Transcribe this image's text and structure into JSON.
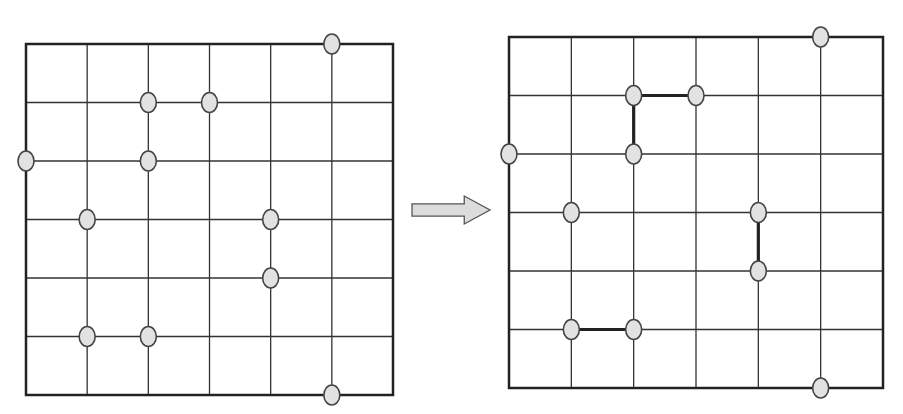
{
  "diagram": {
    "grid_size": 6,
    "node_color": "#e2e2e2",
    "line_color": "#333333",
    "arrow_fill": "#dcdcdc",
    "left_grid": {
      "x0": 26,
      "y0": 44,
      "x1": 393,
      "y1": 395,
      "nodes": [
        [
          5,
          0
        ],
        [
          2,
          1
        ],
        [
          3,
          1
        ],
        [
          0,
          2
        ],
        [
          2,
          2
        ],
        [
          1,
          3
        ],
        [
          4,
          3
        ],
        [
          4,
          4
        ],
        [
          1,
          5
        ],
        [
          2,
          5
        ],
        [
          5,
          6
        ]
      ],
      "links": []
    },
    "right_grid": {
      "x0": 509,
      "y0": 37,
      "x1": 883,
      "y1": 388,
      "nodes": [
        [
          5,
          0
        ],
        [
          2,
          1
        ],
        [
          3,
          1
        ],
        [
          0,
          2
        ],
        [
          2,
          2
        ],
        [
          1,
          3
        ],
        [
          4,
          3
        ],
        [
          4,
          4
        ],
        [
          1,
          5
        ],
        [
          2,
          5
        ],
        [
          5,
          6
        ]
      ],
      "links": [
        [
          [
            2,
            1
          ],
          [
            3,
            1
          ]
        ],
        [
          [
            2,
            1
          ],
          [
            2,
            2
          ]
        ],
        [
          [
            4,
            3
          ],
          [
            4,
            4
          ]
        ],
        [
          [
            1,
            5
          ],
          [
            2,
            5
          ]
        ]
      ]
    },
    "arrow": {
      "x": 412,
      "y": 196,
      "w": 78,
      "h": 28,
      "direction": "right"
    }
  }
}
